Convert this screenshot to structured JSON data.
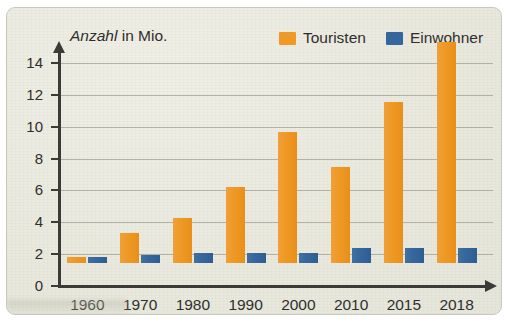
{
  "axis_title": {
    "emphasis": "Anzahl",
    "rest": " in Mio."
  },
  "legend": {
    "items": [
      {
        "label": "Touristen",
        "color": "#ef9a27"
      },
      {
        "label": "Einwohner",
        "color": "#35679e"
      }
    ]
  },
  "chart_data": {
    "type": "bar",
    "title": "",
    "subtitle": "",
    "xlabel": "",
    "ylabel": "Anzahl in Mio.",
    "categories": [
      "1960",
      "1970",
      "1980",
      "1990",
      "2000",
      "2010",
      "2015",
      "2018"
    ],
    "series": [
      {
        "name": "Touristen",
        "color": "#ef9a27",
        "values": [
          0.4,
          1.9,
          2.8,
          4.8,
          8.2,
          6.0,
          10.1,
          13.9
        ]
      },
      {
        "name": "Einwohner",
        "color": "#35679e",
        "values": [
          0.4,
          0.5,
          0.6,
          0.65,
          0.65,
          0.95,
          0.95,
          0.95
        ]
      }
    ],
    "ylim": [
      0,
      14
    ],
    "yticks": [
      0,
      2,
      4,
      6,
      8,
      10,
      12,
      14
    ],
    "ytick_labels": [
      "0",
      "2",
      "4",
      "6",
      "8",
      "10",
      "12",
      "14"
    ],
    "grid": true,
    "grid_axis": "y",
    "legend_position": "top-right",
    "bar_group_mode": "grouped"
  }
}
